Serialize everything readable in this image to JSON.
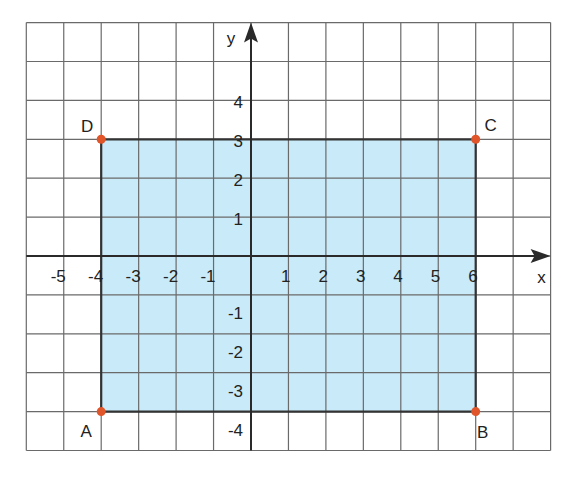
{
  "axes": {
    "x_label": "x",
    "y_label": "y",
    "x_range": [
      -6,
      8
    ],
    "y_range": [
      -5,
      6
    ],
    "x_ticks": [
      -5,
      -4,
      -3,
      -2,
      -1,
      1,
      2,
      3,
      4,
      5,
      6
    ],
    "y_ticks": [
      4,
      3,
      2,
      1,
      -1,
      -2,
      -3,
      -4
    ],
    "grid": true
  },
  "shape": {
    "type": "rectangle",
    "fill": "#c9eaf8",
    "stroke": "#333333",
    "vertices": [
      {
        "name": "A",
        "x": -4,
        "y": -4
      },
      {
        "name": "B",
        "x": 6,
        "y": -4
      },
      {
        "name": "C",
        "x": 6,
        "y": 3
      },
      {
        "name": "D",
        "x": -4,
        "y": 3
      }
    ]
  },
  "point_color": "#e0552a",
  "colors": {
    "grid": "#6a6a6a",
    "axis": "#2a2a2a",
    "text": "#222222"
  }
}
